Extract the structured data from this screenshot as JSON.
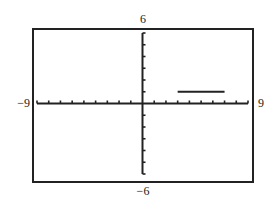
{
  "chart_data": {
    "type": "line",
    "title": "",
    "xlabel": "",
    "ylabel": "",
    "xlim": [
      -9,
      9
    ],
    "ylim": [
      -6,
      6
    ],
    "x_tick_step": 1,
    "y_tick_step": 1,
    "grid": false,
    "window_labels": {
      "xmin": "−9",
      "xmax": "9",
      "ymin": "−6",
      "ymax": "6"
    },
    "series": [
      {
        "name": "segment",
        "points": [
          [
            3,
            1
          ],
          [
            7,
            1
          ]
        ],
        "color": "#222222"
      }
    ]
  }
}
